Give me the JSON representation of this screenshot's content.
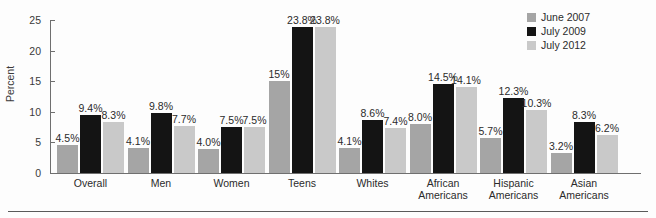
{
  "axis": {
    "ylabel": "Percent",
    "yticks": [
      "0",
      "5",
      "10",
      "15",
      "20",
      "25"
    ]
  },
  "legend": {
    "items": [
      {
        "label": "June 2007",
        "color": "#a5a5a5",
        "swatch_name": "legend-swatch-june-2007"
      },
      {
        "label": "July 2009",
        "color": "#141414",
        "swatch_name": "legend-swatch-july-2009"
      },
      {
        "label": "July 2012",
        "color": "#c9c9c9",
        "swatch_name": "legend-swatch-july-2012"
      }
    ]
  },
  "chart_data": {
    "type": "bar",
    "title": "",
    "xlabel": "",
    "ylabel": "Percent",
    "ylim": [
      0,
      25
    ],
    "yticks": [
      0,
      5,
      10,
      15,
      20,
      25
    ],
    "grid": false,
    "legend_position": "top-right",
    "categories": [
      "Overall",
      "Men",
      "Women",
      "Teens",
      "Whites",
      "African Americans",
      "Hispanic Americans",
      "Asian Americans"
    ],
    "category_lines": [
      [
        "Overall"
      ],
      [
        "Men"
      ],
      [
        "Women"
      ],
      [
        "Teens"
      ],
      [
        "Whites"
      ],
      [
        "African",
        "Americans"
      ],
      [
        "Hispanic",
        "Americans"
      ],
      [
        "Asian",
        "Americans"
      ]
    ],
    "series": [
      {
        "name": "June 2007",
        "color": "#a5a5a5",
        "values": [
          4.5,
          4.1,
          4.0,
          15.0,
          4.1,
          8.0,
          5.7,
          3.2
        ],
        "labels": [
          "4.5%",
          "4.1%",
          "4.0%",
          "15%",
          "4.1%",
          "8.0%",
          "5.7%",
          "3.2%"
        ]
      },
      {
        "name": "July 2009",
        "color": "#141414",
        "values": [
          9.4,
          9.8,
          7.5,
          23.8,
          8.6,
          14.5,
          12.3,
          8.3
        ],
        "labels": [
          "9.4%",
          "9.8%",
          "7.5%",
          "23.8%",
          "8.6%",
          "14.5%",
          "12.3%",
          "8.3%"
        ]
      },
      {
        "name": "July 2012",
        "color": "#c9c9c9",
        "values": [
          8.3,
          7.7,
          7.5,
          23.8,
          7.4,
          14.1,
          10.3,
          6.2
        ],
        "labels": [
          "8.3%",
          "7.7%",
          "7.5%",
          "23.8%",
          "7.4%",
          "14.1%",
          "10.3%",
          "6.2%"
        ]
      }
    ]
  }
}
